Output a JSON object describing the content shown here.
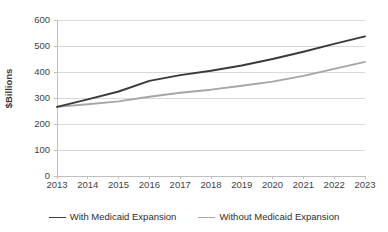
{
  "chart_data": {
    "type": "line",
    "title": "",
    "xlabel": "",
    "ylabel": "$Billions",
    "categories": [
      "2013",
      "2014",
      "2015",
      "2016",
      "2017",
      "2018",
      "2019",
      "2020",
      "2021",
      "2022",
      "2023"
    ],
    "x_tick_labels": [
      "2013",
      "2014",
      "2015",
      "2016",
      "2017",
      "2018",
      "2019",
      "2020",
      "2021",
      "2022",
      "2023"
    ],
    "y_tick_labels": [
      "0",
      "100",
      "200",
      "300",
      "400",
      "500",
      "600"
    ],
    "y_ticks": [
      0,
      100,
      200,
      300,
      400,
      500,
      600
    ],
    "ylim": [
      0,
      600
    ],
    "grid": "horizontal",
    "legend_position": "bottom",
    "series": [
      {
        "name": "With Medicaid Expansion",
        "color": "#3a3a3a",
        "values": [
          266,
          295,
          325,
          366,
          388,
          405,
          425,
          450,
          478,
          508,
          537
        ]
      },
      {
        "name": "Without Medicaid Expansion",
        "color": "#a6a6a6",
        "values": [
          266,
          276,
          287,
          305,
          320,
          332,
          347,
          363,
          385,
          412,
          439
        ]
      }
    ]
  },
  "axes": {
    "y_title": "$Billions"
  },
  "legend": {
    "items": [
      {
        "label": "With Medicaid Expansion",
        "color": "#3a3a3a"
      },
      {
        "label": "Without Medicaid Expansion",
        "color": "#a6a6a6"
      }
    ]
  },
  "style": {
    "grid_color": "#d9d9d9",
    "axis_color": "#bfbfbf",
    "text_color": "#3f3f3f",
    "background": "#ffffff"
  }
}
